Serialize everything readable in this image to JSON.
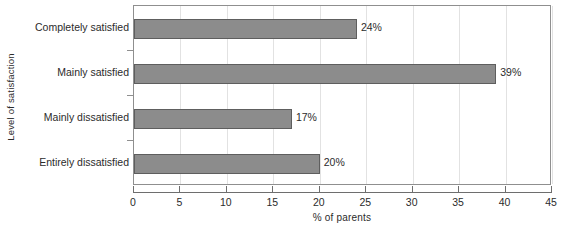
{
  "chart_data": {
    "type": "bar",
    "orientation": "horizontal",
    "title": "",
    "xlabel": "% of parents",
    "ylabel": "Level of satisfaction",
    "categories": [
      "Completely satisfied",
      "Mainly satisfied",
      "Mainly dissatisfied",
      "Entirely dissatisfied"
    ],
    "values": [
      24,
      39,
      17,
      20
    ],
    "value_labels": [
      "24%",
      "39%",
      "17%",
      "20%"
    ],
    "xlim": [
      0,
      45
    ],
    "xticks": [
      0,
      5,
      10,
      15,
      20,
      25,
      30,
      35,
      40,
      45
    ],
    "xtick_labels": [
      "0",
      "5",
      "10",
      "15",
      "20",
      "25",
      "30",
      "35",
      "40",
      "45"
    ],
    "grid": "vertical",
    "legend": "none",
    "colors": {
      "bar_fill": "#8c8c8c",
      "bar_border": "#5e5e5e",
      "gridline": "#e2e2e2",
      "axis": "#6e6e6e",
      "plot_border": "#8f8f8f",
      "text": "#2b2b2b",
      "background": "#ffffff"
    }
  }
}
